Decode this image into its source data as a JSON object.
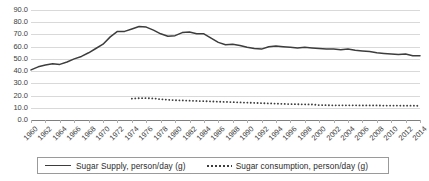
{
  "chart_data": {
    "type": "line",
    "title": "",
    "xlabel": "",
    "ylabel": "",
    "ylim": [
      0.0,
      90.0
    ],
    "ytick_labels": [
      "0.0",
      "10.0",
      "20.0",
      "30.0",
      "40.0",
      "50.0",
      "60.0",
      "70.0",
      "80.0",
      "90.0"
    ],
    "ytick_values": [
      0,
      10,
      20,
      30,
      40,
      50,
      60,
      70,
      80,
      90
    ],
    "grid": true,
    "legend_position": "bottom",
    "x": [
      1960,
      1961,
      1962,
      1963,
      1964,
      1965,
      1966,
      1967,
      1968,
      1969,
      1970,
      1971,
      1972,
      1973,
      1974,
      1975,
      1976,
      1977,
      1978,
      1979,
      1980,
      1981,
      1982,
      1983,
      1984,
      1985,
      1986,
      1987,
      1988,
      1989,
      1990,
      1991,
      1992,
      1993,
      1994,
      1995,
      1996,
      1997,
      1998,
      1999,
      2000,
      2001,
      2002,
      2003,
      2004,
      2005,
      2006,
      2007,
      2008,
      2009,
      2010,
      2011,
      2012,
      2013,
      2014
    ],
    "xtick_labels": [
      "1960",
      "1962",
      "1964",
      "1966",
      "1968",
      "1970",
      "1972",
      "1974",
      "1976",
      "1978",
      "1980",
      "1982",
      "1984",
      "1986",
      "1988",
      "1990",
      "1992",
      "1994",
      "1996",
      "1998",
      "2000",
      "2002",
      "2004",
      "2006",
      "2008",
      "2010",
      "2012",
      "2014"
    ],
    "series": [
      {
        "name": "Sugar Supply, person/day (g)",
        "style": "solid",
        "color": "#3d3d3d",
        "values": [
          41.0,
          43.5,
          45.0,
          46.0,
          45.5,
          47.5,
          50.0,
          52.0,
          55.0,
          58.5,
          62.0,
          68.0,
          72.5,
          72.5,
          74.5,
          76.5,
          76.0,
          73.5,
          70.5,
          68.5,
          69.0,
          71.5,
          72.0,
          70.5,
          70.5,
          67.0,
          63.5,
          61.5,
          62.0,
          61.0,
          59.5,
          58.5,
          58.0,
          60.0,
          60.5,
          60.0,
          59.5,
          59.0,
          59.5,
          59.0,
          58.5,
          58.0,
          58.0,
          57.5,
          58.0,
          57.0,
          56.5,
          56.0,
          55.0,
          54.5,
          54.0,
          53.5,
          54.0,
          52.5,
          52.5
        ]
      },
      {
        "name": "Sugar consumption, person/day (g)",
        "style": "dotted",
        "color": "#3d3d3d",
        "start_year": 1974,
        "values": [
          null,
          null,
          null,
          null,
          null,
          null,
          null,
          null,
          null,
          null,
          null,
          null,
          null,
          null,
          17.5,
          17.8,
          17.9,
          17.6,
          17.0,
          16.5,
          16.2,
          16.0,
          15.8,
          15.6,
          15.4,
          15.2,
          15.0,
          14.8,
          14.6,
          14.4,
          14.2,
          14.0,
          13.8,
          13.6,
          13.4,
          13.2,
          13.0,
          12.9,
          12.8,
          12.7,
          12.2,
          12.1,
          12.0,
          12.0,
          12.0,
          12.0,
          11.9,
          11.9,
          11.9,
          11.8,
          11.8,
          11.8,
          11.7,
          11.7,
          11.6
        ]
      }
    ]
  },
  "legend": {
    "items": [
      {
        "label": "Sugar Supply, person/day (g)",
        "swatch": "solid-line-swatch"
      },
      {
        "label": "Sugar consumption, person/day (g)",
        "swatch": "dotted-line-swatch"
      }
    ]
  }
}
